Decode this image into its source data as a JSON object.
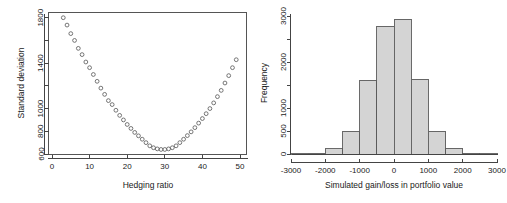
{
  "figure": {
    "background_color": "#ffffff",
    "panel_count": 2
  },
  "chart_data": [
    {
      "type": "scatter",
      "id": "hedging-ratio-standard-deviation",
      "title": "",
      "xlabel": "Hedging ratio",
      "ylabel": "Standard deviation",
      "xlim": [
        0,
        52
      ],
      "ylim": [
        600,
        1850
      ],
      "xticks": [
        0,
        10,
        20,
        30,
        40,
        50
      ],
      "xtick_labels": [
        "0",
        "10",
        "20",
        "30",
        "40",
        "50"
      ],
      "yticks": [
        600,
        800,
        1000,
        1200,
        1400,
        1600,
        1800
      ],
      "ytick_labels": [
        "600",
        "800",
        "1000",
        "",
        "1400",
        "",
        "1800"
      ],
      "ytick_labels_shown": [
        "600",
        "800",
        "1000",
        "1400",
        "1800"
      ],
      "grid": false,
      "legend": null,
      "marker": "open-circle",
      "marker_color": "#555555",
      "x": [
        3,
        4,
        5,
        6,
        7,
        8,
        9,
        10,
        11,
        12,
        13,
        14,
        15,
        16,
        17,
        18,
        19,
        20,
        21,
        22,
        23,
        24,
        25,
        26,
        27,
        28,
        29,
        30,
        31,
        32,
        33,
        34,
        35,
        36,
        37,
        38,
        39,
        40,
        41,
        42,
        43,
        44,
        45,
        46,
        47,
        48,
        49
      ],
      "y": [
        1800,
        1735,
        1660,
        1600,
        1530,
        1475,
        1410,
        1360,
        1300,
        1240,
        1180,
        1125,
        1070,
        1035,
        985,
        940,
        900,
        860,
        825,
        790,
        760,
        730,
        700,
        672,
        655,
        645,
        640,
        640,
        645,
        655,
        672,
        700,
        730,
        762,
        795,
        832,
        872,
        912,
        955,
        1000,
        1050,
        1105,
        1160,
        1225,
        1290,
        1360,
        1430
      ],
      "annotation": "U-shaped curve; minimum standard deviation approximately 640 near hedging ratio 27"
    },
    {
      "type": "bar",
      "subtype": "histogram",
      "id": "simulated-gain-loss-histogram",
      "title": "",
      "xlabel": "Simulated gain/loss in portfolio value",
      "ylabel": "Frequency",
      "xlim": [
        -3000,
        3000
      ],
      "ylim": [
        0,
        3050
      ],
      "xticks": [
        -3000,
        -2000,
        -1000,
        0,
        1000,
        2000,
        3000
      ],
      "xtick_labels": [
        "-3000",
        "-2000",
        "-1000",
        "0",
        "1000",
        "2000",
        "3000"
      ],
      "yticks": [
        0,
        500,
        1000,
        1500,
        2000,
        2500,
        3000
      ],
      "ytick_labels_shown": [
        "0",
        "500",
        "1000",
        "2000",
        "3000"
      ],
      "grid": false,
      "legend": null,
      "bin_width": 500,
      "bar_fill_color": "#d4d4d4",
      "bar_border_color": "#5a5a5a",
      "bin_edges": [
        -3000,
        -2500,
        -2000,
        -1500,
        -1000,
        -500,
        0,
        500,
        1000,
        1500,
        2000,
        2500,
        3000
      ],
      "bin_centers": [
        -2750,
        -2250,
        -1750,
        -1250,
        -750,
        -250,
        250,
        750,
        1250,
        1750,
        2250,
        2750
      ],
      "values": [
        5,
        15,
        110,
        490,
        1600,
        2780,
        2930,
        1630,
        490,
        120,
        20,
        5
      ],
      "categories": [
        "-3000 to -2500",
        "-2500 to -2000",
        "-2000 to -1500",
        "-1500 to -1000",
        "-1000 to -500",
        "-500 to 0",
        "0 to 500",
        "500 to 1000",
        "1000 to 1500",
        "1500 to 2000",
        "2000 to 2500",
        "2500 to 3000"
      ]
    }
  ]
}
